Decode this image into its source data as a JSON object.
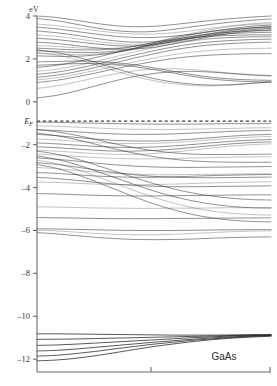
{
  "figure": {
    "material_label": "GaAs",
    "unit_label": "eV",
    "fermi_label": "E",
    "fermi_sub": "F"
  },
  "chart_data": {
    "type": "line",
    "title": "GaAs",
    "subtitle": "",
    "xlabel": "",
    "ylabel": "eV",
    "ylim": [
      -12.6,
      4.0
    ],
    "xlim": [
      0,
      1
    ],
    "grid": false,
    "legend": null,
    "unit": "eV",
    "ytick_labels": [
      "4",
      "2",
      "0",
      "-2",
      "-4",
      "-6",
      "-8",
      "-10",
      "-12"
    ],
    "ytick_values": [
      4,
      2,
      0,
      -2,
      -4,
      -6,
      -8,
      -10,
      -12
    ],
    "xtick_values": [
      0.5,
      1.0
    ],
    "xtick_labels": [
      "",
      ""
    ],
    "annotations": [
      {
        "text": "GaAs",
        "x": 0.82,
        "y": -11.6
      },
      {
        "text": "E_F",
        "x": -0.06,
        "y": -0.9
      }
    ],
    "reference_lines": [
      {
        "name": "fermi_level",
        "orientation": "horizontal",
        "value": -0.9,
        "style": "dashed",
        "label": "E_F"
      }
    ],
    "band_gap_regions": [
      {
        "from": -10.5,
        "to": -6.5,
        "name": "ionic-gap"
      }
    ],
    "series": [
      {
        "name": "c1",
        "values": [
          4.0,
          3.93,
          3.8,
          3.66,
          3.55,
          3.5,
          3.52,
          3.6,
          3.7,
          3.8,
          3.88,
          3.95,
          4.0
        ]
      },
      {
        "name": "c2",
        "values": [
          3.88,
          3.78,
          3.62,
          3.45,
          3.32,
          3.26,
          3.28,
          3.38,
          3.5,
          3.62,
          3.72,
          3.8,
          3.86
        ]
      },
      {
        "name": "c3",
        "values": [
          3.62,
          3.55,
          3.44,
          3.32,
          3.22,
          3.16,
          3.16,
          3.22,
          3.32,
          3.44,
          3.55,
          3.64,
          3.7
        ]
      },
      {
        "name": "c4",
        "values": [
          3.48,
          3.4,
          3.28,
          3.16,
          3.06,
          3.0,
          3.0,
          3.06,
          3.16,
          3.3,
          3.42,
          3.52,
          3.58
        ]
      },
      {
        "name": "c5",
        "values": [
          3.3,
          3.22,
          3.1,
          2.96,
          2.84,
          2.78,
          2.8,
          2.9,
          3.04,
          3.2,
          3.34,
          3.45,
          3.52
        ]
      },
      {
        "name": "c6",
        "values": [
          3.12,
          3.05,
          2.94,
          2.82,
          2.72,
          2.68,
          2.72,
          2.84,
          3.0,
          3.16,
          3.3,
          3.4,
          3.46
        ]
      },
      {
        "name": "c7",
        "values": [
          2.96,
          2.9,
          2.8,
          2.7,
          2.62,
          2.6,
          2.66,
          2.8,
          2.96,
          3.12,
          3.26,
          3.36,
          3.42
        ]
      },
      {
        "name": "c8",
        "values": [
          2.78,
          2.72,
          2.62,
          2.52,
          2.46,
          2.46,
          2.54,
          2.7,
          2.88,
          3.06,
          3.2,
          3.3,
          3.36
        ]
      },
      {
        "name": "c9",
        "values": [
          2.62,
          2.58,
          2.52,
          2.48,
          2.5,
          2.6,
          2.78,
          3.0,
          3.2,
          3.38,
          3.52,
          3.6,
          3.64
        ]
      },
      {
        "name": "c10",
        "values": [
          2.5,
          2.46,
          2.42,
          2.42,
          2.46,
          2.58,
          2.76,
          2.96,
          3.14,
          3.28,
          3.38,
          3.44,
          3.48
        ]
      },
      {
        "name": "c11",
        "values": [
          2.38,
          2.34,
          2.3,
          2.3,
          2.36,
          2.48,
          2.64,
          2.82,
          2.98,
          3.1,
          3.18,
          3.22,
          3.24
        ]
      },
      {
        "name": "c12",
        "values": [
          2.26,
          2.22,
          2.2,
          2.22,
          2.3,
          2.44,
          2.6,
          2.76,
          2.88,
          2.96,
          3.0,
          3.02,
          3.02
        ]
      },
      {
        "name": "c13",
        "values": [
          2.14,
          2.12,
          2.12,
          2.18,
          2.3,
          2.48,
          2.7,
          2.9,
          3.06,
          3.18,
          3.26,
          3.3,
          3.32
        ]
      },
      {
        "name": "c14",
        "values": [
          1.6,
          1.7,
          1.86,
          2.06,
          2.28,
          2.5,
          2.7,
          2.86,
          2.98,
          3.06,
          3.1,
          3.12,
          3.12
        ]
      },
      {
        "name": "c15",
        "values": [
          1.42,
          1.52,
          1.68,
          1.88,
          2.1,
          2.32,
          2.52,
          2.7,
          2.84,
          2.94,
          3.0,
          3.04,
          3.06
        ]
      },
      {
        "name": "c16",
        "values": [
          1.28,
          1.38,
          1.54,
          1.74,
          1.96,
          2.18,
          2.38,
          2.56,
          2.7,
          2.8,
          2.86,
          2.9,
          2.92
        ]
      },
      {
        "name": "c17",
        "values": [
          1.14,
          1.24,
          1.4,
          1.6,
          1.82,
          2.04,
          2.24,
          2.42,
          2.56,
          2.66,
          2.72,
          2.76,
          2.78
        ]
      },
      {
        "name": "c18",
        "values": [
          1.02,
          1.12,
          1.28,
          1.46,
          1.66,
          1.86,
          2.04,
          2.2,
          2.32,
          2.4,
          2.46,
          2.48,
          2.5
        ]
      },
      {
        "name": "c19",
        "values": [
          0.9,
          1.0,
          1.16,
          1.34,
          1.54,
          1.72,
          1.88,
          2.02,
          2.12,
          2.18,
          2.22,
          2.24,
          2.24
        ]
      },
      {
        "name": "c20",
        "values": [
          2.42,
          2.3,
          2.1,
          1.84,
          1.56,
          1.3,
          1.08,
          0.92,
          0.82,
          0.78,
          0.8,
          0.86,
          0.92
        ]
      },
      {
        "name": "c21",
        "values": [
          2.3,
          2.18,
          1.98,
          1.72,
          1.44,
          1.18,
          0.98,
          0.84,
          0.76,
          0.74,
          0.78,
          0.86,
          0.94
        ]
      },
      {
        "name": "c22",
        "values": [
          1.86,
          1.88,
          1.9,
          1.88,
          1.82,
          1.72,
          1.58,
          1.42,
          1.26,
          1.14,
          1.06,
          1.02,
          1.0
        ]
      },
      {
        "name": "c23",
        "values": [
          1.7,
          1.74,
          1.78,
          1.78,
          1.74,
          1.64,
          1.5,
          1.34,
          1.18,
          1.06,
          0.98,
          0.94,
          0.92
        ]
      },
      {
        "name": "c24",
        "values": [
          0.62,
          0.74,
          0.92,
          1.12,
          1.3,
          1.44,
          1.52,
          1.54,
          1.5,
          1.42,
          1.32,
          1.24,
          1.2
        ]
      },
      {
        "name": "c25",
        "values": [
          0.18,
          0.3,
          0.5,
          0.74,
          0.98,
          1.18,
          1.32,
          1.4,
          1.42,
          1.38,
          1.32,
          1.26,
          1.22
        ]
      },
      {
        "name": "v1",
        "values": [
          -0.95,
          -0.96,
          -0.98,
          -1.0,
          -1.02,
          -1.03,
          -1.04,
          -1.04,
          -1.04,
          -1.03,
          -1.02,
          -1.02,
          -1.01
        ]
      },
      {
        "name": "v2",
        "values": [
          -1.12,
          -1.14,
          -1.18,
          -1.22,
          -1.26,
          -1.28,
          -1.29,
          -1.29,
          -1.28,
          -1.26,
          -1.24,
          -1.22,
          -1.21
        ]
      },
      {
        "name": "v3",
        "values": [
          -1.3,
          -1.34,
          -1.4,
          -1.46,
          -1.5,
          -1.52,
          -1.52,
          -1.5,
          -1.46,
          -1.42,
          -1.38,
          -1.35,
          -1.33
        ]
      },
      {
        "name": "v4",
        "values": [
          -1.52,
          -1.58,
          -1.66,
          -1.74,
          -1.8,
          -1.83,
          -1.83,
          -1.8,
          -1.74,
          -1.67,
          -1.6,
          -1.55,
          -1.52
        ]
      },
      {
        "name": "v5",
        "values": [
          -1.74,
          -1.78,
          -1.84,
          -1.9,
          -1.94,
          -1.95,
          -1.94,
          -1.9,
          -1.84,
          -1.77,
          -1.7,
          -1.65,
          -1.62
        ]
      },
      {
        "name": "v6",
        "values": [
          -1.92,
          -1.96,
          -2.02,
          -2.08,
          -2.12,
          -2.13,
          -2.11,
          -2.06,
          -1.99,
          -1.91,
          -1.84,
          -1.79,
          -1.76
        ]
      },
      {
        "name": "v7",
        "values": [
          -2.1,
          -2.14,
          -2.2,
          -2.26,
          -2.3,
          -2.3,
          -2.27,
          -2.21,
          -2.13,
          -2.04,
          -1.96,
          -1.9,
          -1.87
        ]
      },
      {
        "name": "v8",
        "values": [
          -2.26,
          -2.3,
          -2.36,
          -2.42,
          -2.45,
          -2.45,
          -2.41,
          -2.34,
          -2.25,
          -2.15,
          -2.06,
          -2.0,
          -1.96
        ]
      },
      {
        "name": "v9",
        "values": [
          -1.3,
          -1.4,
          -1.56,
          -1.76,
          -1.96,
          -2.14,
          -2.28,
          -2.38,
          -2.44,
          -2.46,
          -2.46,
          -2.45,
          -2.44
        ]
      },
      {
        "name": "v10",
        "values": [
          -1.46,
          -1.58,
          -1.76,
          -1.98,
          -2.2,
          -2.4,
          -2.56,
          -2.68,
          -2.76,
          -2.8,
          -2.82,
          -2.82,
          -2.82
        ]
      },
      {
        "name": "v11",
        "values": [
          -2.44,
          -2.48,
          -2.54,
          -2.6,
          -2.64,
          -2.66,
          -2.66,
          -2.64,
          -2.62,
          -2.6,
          -2.58,
          -2.57,
          -2.56
        ]
      },
      {
        "name": "v12",
        "values": [
          -2.62,
          -2.68,
          -2.76,
          -2.86,
          -2.94,
          -3.0,
          -3.04,
          -3.06,
          -3.06,
          -3.05,
          -3.04,
          -3.03,
          -3.02
        ]
      },
      {
        "name": "v13",
        "values": [
          -2.84,
          -2.92,
          -3.04,
          -3.18,
          -3.3,
          -3.4,
          -3.48,
          -3.52,
          -3.54,
          -3.54,
          -3.53,
          -3.52,
          -3.51
        ]
      },
      {
        "name": "v14",
        "values": [
          -3.06,
          -3.12,
          -3.2,
          -3.28,
          -3.34,
          -3.38,
          -3.4,
          -3.4,
          -3.39,
          -3.38,
          -3.37,
          -3.36,
          -3.36
        ]
      },
      {
        "name": "v15",
        "values": [
          -3.3,
          -3.34,
          -3.4,
          -3.46,
          -3.5,
          -3.52,
          -3.52,
          -3.5,
          -3.47,
          -3.44,
          -3.42,
          -3.4,
          -3.39
        ]
      },
      {
        "name": "v16",
        "values": [
          -3.52,
          -3.58,
          -3.66,
          -3.76,
          -3.84,
          -3.9,
          -3.94,
          -3.96,
          -3.96,
          -3.95,
          -3.94,
          -3.93,
          -3.92
        ]
      },
      {
        "name": "v17",
        "values": [
          -3.74,
          -3.76,
          -3.8,
          -3.84,
          -3.86,
          -3.87,
          -3.86,
          -3.84,
          -3.81,
          -3.78,
          -3.76,
          -3.74,
          -3.73
        ]
      },
      {
        "name": "v18",
        "values": [
          -2.3,
          -2.44,
          -2.66,
          -2.94,
          -3.24,
          -3.54,
          -3.82,
          -4.06,
          -4.26,
          -4.4,
          -4.5,
          -4.56,
          -4.58
        ]
      },
      {
        "name": "v19",
        "values": [
          -2.52,
          -2.68,
          -2.92,
          -3.22,
          -3.54,
          -3.86,
          -4.16,
          -4.42,
          -4.62,
          -4.78,
          -4.88,
          -4.94,
          -4.96
        ]
      },
      {
        "name": "v20",
        "values": [
          -2.72,
          -2.88,
          -3.14,
          -3.46,
          -3.8,
          -4.14,
          -4.46,
          -4.72,
          -4.94,
          -5.1,
          -5.2,
          -5.26,
          -5.28
        ]
      },
      {
        "name": "v21",
        "values": [
          -2.92,
          -3.1,
          -3.38,
          -3.72,
          -4.08,
          -4.44,
          -4.76,
          -5.04,
          -5.26,
          -5.42,
          -5.52,
          -5.58,
          -5.6
        ]
      },
      {
        "name": "v22",
        "values": [
          -4.28,
          -4.3,
          -4.33,
          -4.36,
          -4.38,
          -4.39,
          -4.39,
          -4.38,
          -4.37,
          -4.36,
          -4.35,
          -4.34,
          -4.34
        ]
      },
      {
        "name": "v23",
        "values": [
          -4.9,
          -4.91,
          -4.93,
          -4.95,
          -4.96,
          -4.97,
          -4.97,
          -4.96,
          -4.96,
          -4.95,
          -4.94,
          -4.94,
          -4.93
        ]
      },
      {
        "name": "v24",
        "values": [
          -5.4,
          -5.41,
          -5.42,
          -5.44,
          -5.45,
          -5.45,
          -5.45,
          -5.44,
          -5.44,
          -5.43,
          -5.42,
          -5.42,
          -5.41
        ]
      },
      {
        "name": "v25",
        "values": [
          -5.92,
          -5.93,
          -5.95,
          -5.97,
          -5.99,
          -6.0,
          -6.0,
          -6.0,
          -5.99,
          -5.98,
          -5.97,
          -5.96,
          -5.96
        ]
      },
      {
        "name": "v26",
        "values": [
          -5.98,
          -6.02,
          -6.08,
          -6.14,
          -6.18,
          -6.2,
          -6.2,
          -6.18,
          -6.14,
          -6.1,
          -6.06,
          -6.03,
          -6.02
        ]
      },
      {
        "name": "v27",
        "values": [
          -6.1,
          -6.16,
          -6.24,
          -6.32,
          -6.38,
          -6.42,
          -6.43,
          -6.42,
          -6.4,
          -6.36,
          -6.33,
          -6.31,
          -6.3
        ]
      },
      {
        "name": "s1",
        "values": [
          -10.82,
          -10.82,
          -10.83,
          -10.84,
          -10.85,
          -10.86,
          -10.87,
          -10.88,
          -10.88,
          -10.88,
          -10.87,
          -10.86,
          -10.85
        ]
      },
      {
        "name": "s2",
        "values": [
          -11.08,
          -11.07,
          -11.06,
          -11.04,
          -11.02,
          -11.0,
          -10.98,
          -10.96,
          -10.94,
          -10.92,
          -10.9,
          -10.88,
          -10.87
        ]
      },
      {
        "name": "s3",
        "values": [
          -11.36,
          -11.34,
          -11.3,
          -11.25,
          -11.2,
          -11.15,
          -11.1,
          -11.05,
          -11.0,
          -10.96,
          -10.92,
          -10.9,
          -10.88
        ]
      },
      {
        "name": "s4",
        "values": [
          -11.62,
          -11.59,
          -11.53,
          -11.45,
          -11.37,
          -11.29,
          -11.21,
          -11.14,
          -11.07,
          -11.01,
          -10.96,
          -10.92,
          -10.9
        ]
      },
      {
        "name": "s5",
        "values": [
          -11.86,
          -11.82,
          -11.74,
          -11.64,
          -11.52,
          -11.41,
          -11.3,
          -11.21,
          -11.12,
          -11.05,
          -10.99,
          -10.94,
          -10.91
        ]
      },
      {
        "name": "s6",
        "values": [
          -12.08,
          -12.04,
          -11.96,
          -11.84,
          -11.7,
          -11.55,
          -11.41,
          -11.29,
          -11.18,
          -11.09,
          -11.02,
          -10.97,
          -10.93
        ]
      }
    ]
  }
}
